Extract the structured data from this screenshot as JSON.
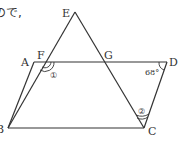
{
  "intro_text": "ので,",
  "figure": {
    "points": {
      "A": "A",
      "B": "B",
      "C": "C",
      "D": "D",
      "E": "E",
      "F": "F",
      "G": "G"
    },
    "angle_D": "68°",
    "angle_mark_1": "①",
    "angle_mark_2": "②",
    "segments": [
      "AD",
      "BC",
      "AB",
      "DC",
      "EB",
      "EC"
    ]
  }
}
